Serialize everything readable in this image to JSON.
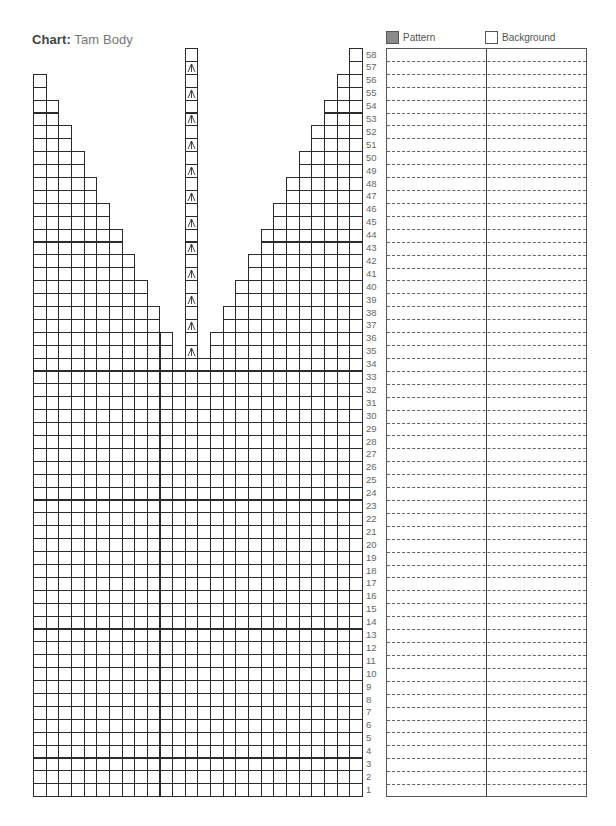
{
  "header": {
    "title_bold": "Chart:",
    "title_rest": " Tam Body"
  },
  "legend": {
    "items": [
      {
        "label": "Pattern",
        "color": "#8a8a8a",
        "icon": "filled-swatch-icon"
      },
      {
        "label": "Background",
        "color": "#ffffff",
        "icon": "empty-swatch-icon"
      }
    ]
  },
  "chart_data": {
    "type": "knitting-chart",
    "title": "Chart: Tam Body",
    "columns": 26,
    "rows": 58,
    "row_labels": [
      "1",
      "2",
      "3",
      "4",
      "5",
      "6",
      "7",
      "8",
      "9",
      "10",
      "11",
      "12",
      "13",
      "14",
      "15",
      "16",
      "17",
      "18",
      "19",
      "20",
      "21",
      "22",
      "23",
      "24",
      "25",
      "26",
      "27",
      "28",
      "29",
      "30",
      "31",
      "32",
      "33",
      "34",
      "35",
      "36",
      "37",
      "38",
      "39",
      "40",
      "41",
      "42",
      "43",
      "44",
      "45",
      "46",
      "47",
      "48",
      "49",
      "50",
      "51",
      "52",
      "53",
      "54",
      "55",
      "56",
      "57",
      "58"
    ],
    "full_width_rows": "1-34",
    "center_column": 13,
    "center_column_rows": "35-58",
    "decrease_symbol": "central double decrease (arrow up)",
    "decrease_rows": [
      35,
      37,
      39,
      41,
      43,
      45,
      47,
      49,
      51,
      53,
      55,
      57
    ],
    "left_wedge_columns_by_row": {
      "35": 11,
      "36": 11,
      "37": 10,
      "38": 10,
      "39": 9,
      "40": 9,
      "41": 8,
      "42": 8,
      "43": 7,
      "44": 7,
      "45": 6,
      "46": 6,
      "47": 5,
      "48": 5,
      "49": 4,
      "50": 4,
      "51": 3,
      "52": 3,
      "53": 2,
      "54": 2,
      "55": 1,
      "56": 1,
      "57": 0,
      "58": 0
    },
    "right_wedge_columns_by_row": {
      "35": 12,
      "36": 12,
      "37": 11,
      "38": 11,
      "39": 10,
      "40": 10,
      "41": 9,
      "42": 9,
      "43": 8,
      "44": 8,
      "45": 7,
      "46": 7,
      "47": 6,
      "48": 6,
      "49": 5,
      "50": 5,
      "51": 4,
      "52": 4,
      "53": 3,
      "54": 3,
      "55": 2,
      "56": 2,
      "57": 1,
      "58": 1
    },
    "legend": [
      "Pattern",
      "Background"
    ],
    "notes_panel": {
      "columns": 2,
      "rows": 58
    }
  },
  "colors": {
    "grid_line": "#2b2b2b",
    "pattern": "#8a8a8a",
    "background": "#ffffff"
  }
}
